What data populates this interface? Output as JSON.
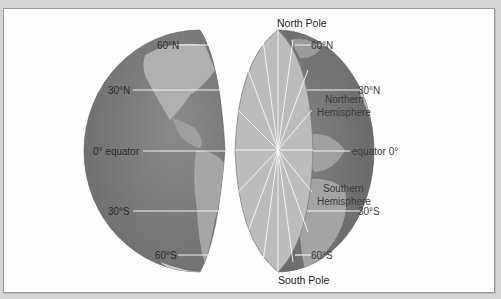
{
  "diagram": {
    "left_globe": {
      "latitude_labels": [
        "60°N",
        "30°N",
        "0° equator",
        "30°S",
        "60°S"
      ]
    },
    "right_globe": {
      "top_label": "North Pole",
      "bottom_label": "South Pole",
      "latitude_labels": [
        "60°N",
        "30°N",
        "equator 0°",
        "30°S",
        "60°S"
      ],
      "northern_label_line1": "Northern",
      "northern_label_line2": "Hemisphere",
      "southern_label_line1": "Southern",
      "southern_label_line2": "Hemisphere"
    },
    "colors": {
      "ocean": "#7b7b7b",
      "land": "#a9a9a9",
      "cross_section": "#b9b9b9",
      "lines": "#f4f4f4",
      "background": "#d4d4d4",
      "frame": "#fefefe"
    }
  }
}
